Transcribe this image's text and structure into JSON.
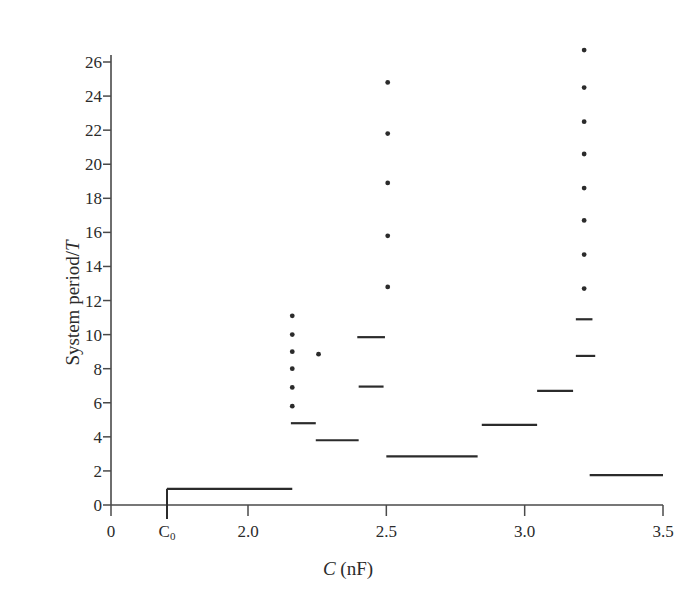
{
  "chart_data": {
    "type": "scatter",
    "title": "",
    "xlabel": "C (nF)",
    "xlabel_italic_part": "C",
    "xlabel_rest": " (nF)",
    "ylabel": "System period/T",
    "ylabel_plain": "System period/",
    "ylabel_italic_part": "T",
    "xlim": [
      0,
      3.5
    ],
    "ylim": [
      0,
      27.6
    ],
    "grid": false,
    "legend": null,
    "x_tick_labels": [
      "0",
      "C₀",
      "2.0",
      "2.5",
      "3.0",
      "3.5"
    ],
    "x_tick_values": [
      0,
      1.72,
      2.0,
      2.5,
      3.0,
      3.5
    ],
    "x_axis_note": "axis is broken between 0 and C0",
    "y_tick_labels": [
      "0",
      "2",
      "4",
      "6",
      "8",
      "10",
      "12",
      "14",
      "16",
      "18",
      "20",
      "22",
      "24",
      "26"
    ],
    "y_tick_values": [
      0,
      2,
      4,
      6,
      8,
      10,
      12,
      14,
      16,
      18,
      20,
      22,
      24,
      26
    ],
    "marker_color": "#2b2b2b",
    "axis_color": "#4a4a4a",
    "series": [
      {
        "name": "period-1 plateau",
        "type": "segment",
        "segments": [
          {
            "x0": 1.72,
            "x1": 2.16,
            "y": 0.95,
            "riser_from": 0.0
          }
        ]
      },
      {
        "name": "period plateaus",
        "type": "segment",
        "segments": [
          {
            "x0": 2.155,
            "x1": 2.245,
            "y": 4.8
          },
          {
            "x0": 2.245,
            "x1": 2.4,
            "y": 3.8
          },
          {
            "x0": 2.395,
            "x1": 2.495,
            "y": 9.85
          },
          {
            "x0": 2.4,
            "x1": 2.49,
            "y": 6.95
          },
          {
            "x0": 2.5,
            "x1": 2.83,
            "y": 2.85
          },
          {
            "x0": 2.845,
            "x1": 3.045,
            "y": 4.7
          },
          {
            "x0": 3.045,
            "x1": 3.175,
            "y": 6.7
          },
          {
            "x0": 3.185,
            "x1": 3.245,
            "y": 10.9
          },
          {
            "x0": 3.185,
            "x1": 3.255,
            "y": 8.75
          },
          {
            "x0": 3.235,
            "x1": 3.5,
            "y": 1.75
          }
        ]
      },
      {
        "name": "cascade at C = 2.16",
        "type": "points",
        "x": 2.16,
        "values": [
          5.8,
          6.9,
          8.0,
          9.0,
          10.0,
          11.1
        ]
      },
      {
        "name": "isolated point at C = 2.25",
        "type": "points",
        "x": 2.255,
        "values": [
          8.85
        ]
      },
      {
        "name": "cascade at C = 2.50",
        "type": "points",
        "x": 2.505,
        "values": [
          12.8,
          15.8,
          18.9,
          21.8,
          24.8
        ]
      },
      {
        "name": "cascade at C = 3.22",
        "type": "points",
        "x": 3.215,
        "values": [
          12.7,
          14.7,
          16.7,
          18.6,
          20.6,
          22.5,
          24.5,
          26.7
        ]
      }
    ]
  },
  "figure": {
    "background_color": "#ffffff"
  }
}
